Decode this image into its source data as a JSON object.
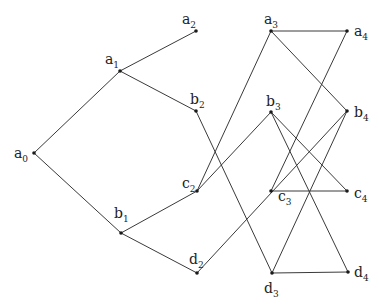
{
  "diagram": {
    "type": "graph",
    "colors": {
      "edge": "#3a3a3a",
      "node": "#1a1a1a",
      "label": "#222222",
      "background": "#ffffff"
    },
    "nodes": [
      {
        "id": "a0",
        "base": "a",
        "sub": "0",
        "x": 34,
        "y": 153,
        "lx": 14,
        "ly": 158
      },
      {
        "id": "a1",
        "base": "a",
        "sub": "1",
        "x": 120,
        "y": 71,
        "lx": 105,
        "ly": 64
      },
      {
        "id": "a2",
        "base": "a",
        "sub": "2",
        "x": 196,
        "y": 31,
        "lx": 182,
        "ly": 24
      },
      {
        "id": "b2",
        "base": "b",
        "sub": "2",
        "x": 196,
        "y": 111,
        "lx": 190,
        "ly": 104
      },
      {
        "id": "b1",
        "base": "b",
        "sub": "1",
        "x": 121,
        "y": 233,
        "lx": 114,
        "ly": 218
      },
      {
        "id": "c2",
        "base": "c",
        "sub": "2",
        "x": 197,
        "y": 191,
        "lx": 182,
        "ly": 188
      },
      {
        "id": "d2",
        "base": "d",
        "sub": "2",
        "x": 197,
        "y": 273,
        "lx": 189,
        "ly": 264
      },
      {
        "id": "a3",
        "base": "a",
        "sub": "3",
        "x": 271,
        "y": 31,
        "lx": 264,
        "ly": 24
      },
      {
        "id": "b3",
        "base": "b",
        "sub": "3",
        "x": 271,
        "y": 112,
        "lx": 266,
        "ly": 106
      },
      {
        "id": "c3",
        "base": "c",
        "sub": "3",
        "x": 271,
        "y": 191,
        "lx": 278,
        "ly": 201
      },
      {
        "id": "d3",
        "base": "d",
        "sub": "3",
        "x": 272,
        "y": 273,
        "lx": 264,
        "ly": 293
      },
      {
        "id": "a4",
        "base": "a",
        "sub": "4",
        "x": 347,
        "y": 31,
        "lx": 354,
        "ly": 36
      },
      {
        "id": "b4",
        "base": "b",
        "sub": "4",
        "x": 347,
        "y": 111,
        "lx": 354,
        "ly": 117
      },
      {
        "id": "c4",
        "base": "c",
        "sub": "4",
        "x": 347,
        "y": 191,
        "lx": 354,
        "ly": 198
      },
      {
        "id": "d4",
        "base": "d",
        "sub": "4",
        "x": 348,
        "y": 272,
        "lx": 354,
        "ly": 277
      }
    ],
    "edges": [
      [
        "a0",
        "a1"
      ],
      [
        "a0",
        "b1"
      ],
      [
        "a1",
        "a2"
      ],
      [
        "a1",
        "b2"
      ],
      [
        "b1",
        "c2"
      ],
      [
        "b1",
        "d2"
      ],
      [
        "b2",
        "d3"
      ],
      [
        "c2",
        "a3"
      ],
      [
        "c2",
        "b3"
      ],
      [
        "d2",
        "b4"
      ],
      [
        "a3",
        "a4"
      ],
      [
        "a3",
        "b4"
      ],
      [
        "a4",
        "c3"
      ],
      [
        "b3",
        "c4"
      ],
      [
        "b3",
        "d4"
      ],
      [
        "c3",
        "c4"
      ],
      [
        "d3",
        "d4"
      ],
      [
        "d3",
        "b4"
      ]
    ]
  }
}
